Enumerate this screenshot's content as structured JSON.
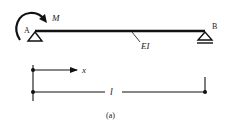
{
  "figure": {
    "caption": "(a)",
    "beam": {
      "left_support_label": "A",
      "right_support_label": "B",
      "stiffness_label": "EI",
      "moment_label": "M"
    },
    "dimensions": {
      "axis_label": "x",
      "length_label": "l"
    },
    "colors": {
      "ink": "#111111",
      "background": "#ffffff"
    }
  }
}
